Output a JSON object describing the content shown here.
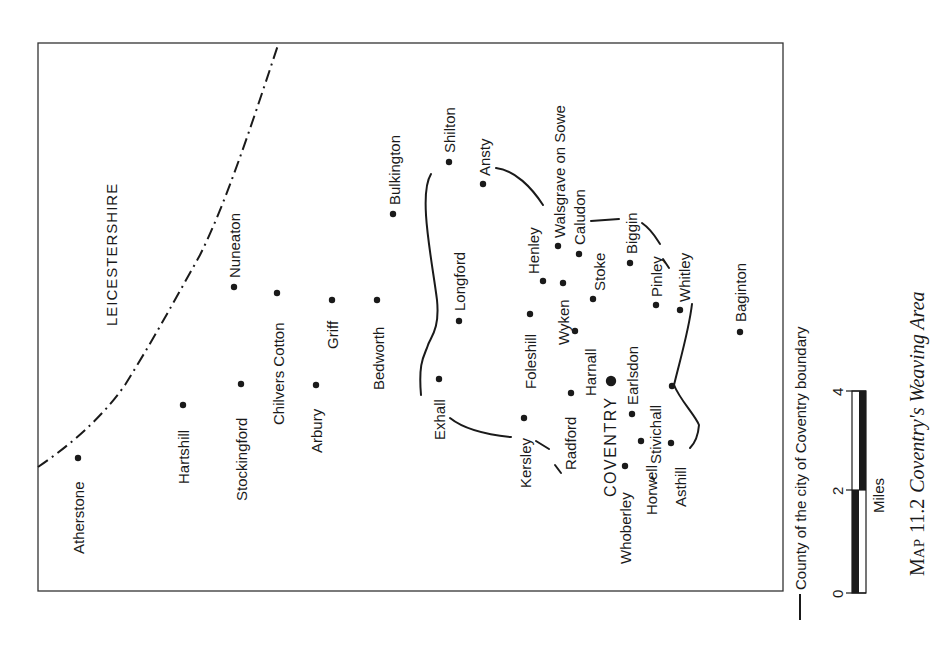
{
  "map": {
    "county_label": "LEICESTERSHIRE",
    "city_label": "COVENTRY",
    "places": [
      {
        "name": "Atherstone"
      },
      {
        "name": "Hartshill"
      },
      {
        "name": "Stockingford"
      },
      {
        "name": "Nuneaton"
      },
      {
        "name": "Chilvers Cotton"
      },
      {
        "name": "Arbury"
      },
      {
        "name": "Griff"
      },
      {
        "name": "Bedworth"
      },
      {
        "name": "Bulkington"
      },
      {
        "name": "Shilton"
      },
      {
        "name": "Ansty"
      },
      {
        "name": "Longford"
      },
      {
        "name": "Exhall"
      },
      {
        "name": "Foleshill"
      },
      {
        "name": "Kersley"
      },
      {
        "name": "Henley"
      },
      {
        "name": "Walsgrave on Sowe"
      },
      {
        "name": "Wyken"
      },
      {
        "name": "Caludon"
      },
      {
        "name": "Harnall"
      },
      {
        "name": "Radford"
      },
      {
        "name": "Stoke"
      },
      {
        "name": "Biggin"
      },
      {
        "name": "Earlsdon"
      },
      {
        "name": "Whoberley"
      },
      {
        "name": "Stivichall"
      },
      {
        "name": "Pinley"
      },
      {
        "name": "Horwell"
      },
      {
        "name": "Whitley"
      },
      {
        "name": "Asthill"
      },
      {
        "name": "Baginton"
      }
    ]
  },
  "legend": {
    "boundary_label": "County of the city of Coventry boundary",
    "scale": {
      "ticks": [
        "0",
        "2",
        "4"
      ],
      "unit": "Miles"
    }
  },
  "caption": {
    "prefix_sc_initial": "M",
    "prefix_sc_rest": "AP",
    "number": "11.2",
    "title": "Coventry's Weaving Area"
  }
}
